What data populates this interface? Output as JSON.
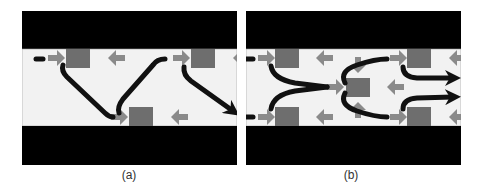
{
  "colors": {
    "wall": "#000000",
    "channel": "#f2f2f2",
    "block": "#6e6e6e",
    "arrow_grey": "#8a8a8a",
    "flow": "#111111"
  },
  "panels": [
    {
      "id": "a",
      "caption": "(a)",
      "x": 22,
      "width": 215,
      "height": 154,
      "channel": {
        "y": 38,
        "h": 77
      },
      "blocks": [
        {
          "x": 33,
          "y": 38,
          "w": 24,
          "h": 19
        },
        {
          "x": 158,
          "y": 38,
          "w": 24,
          "h": 19
        },
        {
          "x": 96,
          "y": 96,
          "w": 24,
          "h": 19
        }
      ],
      "grey_arrows": [
        {
          "x": 15,
          "y": 47,
          "dir": "right"
        },
        {
          "x": 75,
          "y": 47,
          "dir": "left"
        },
        {
          "x": 140,
          "y": 47,
          "dir": "right"
        },
        {
          "x": 200,
          "y": 47,
          "dir": "left"
        },
        {
          "x": 78,
          "y": 106,
          "dir": "right"
        },
        {
          "x": 138,
          "y": 106,
          "dir": "left"
        }
      ],
      "flows": [
        {
          "d": "M 3 48 L 10 48",
          "arrowhead": false
        },
        {
          "d": "M 30 54 Q 28 60 34 66 L 72 102 Q 76 106 80 106",
          "arrowhead": false
        },
        {
          "d": "M 86 102 Q 84 96 90 88 L 120 54 Q 124 48 132 48",
          "arrowhead": false
        },
        {
          "d": "M 151 56 Q 150 64 158 70 L 200 100",
          "arrowhead": true
        }
      ]
    },
    {
      "id": "b",
      "caption": "(b)",
      "x": 246,
      "width": 215,
      "height": 154,
      "channel": {
        "y": 38,
        "h": 77
      },
      "blocks": [
        {
          "x": 18,
          "y": 38,
          "w": 24,
          "h": 19
        },
        {
          "x": 18,
          "y": 96,
          "w": 24,
          "h": 19
        },
        {
          "x": 89,
          "y": 67,
          "w": 24,
          "h": 19
        },
        {
          "x": 150,
          "y": 38,
          "w": 24,
          "h": 19
        },
        {
          "x": 150,
          "y": 96,
          "w": 24,
          "h": 19
        }
      ],
      "grey_arrows": [
        {
          "x": 1,
          "y": 47,
          "dir": "right"
        },
        {
          "x": 59,
          "y": 47,
          "dir": "left"
        },
        {
          "x": 1,
          "y": 106,
          "dir": "right"
        },
        {
          "x": 59,
          "y": 106,
          "dir": "left"
        },
        {
          "x": 70,
          "y": 76,
          "dir": "right"
        },
        {
          "x": 130,
          "y": 76,
          "dir": "left"
        },
        {
          "x": 101,
          "y": 54,
          "dir": "down"
        },
        {
          "x": 101,
          "y": 99,
          "dir": "up"
        },
        {
          "x": 133,
          "y": 47,
          "dir": "right"
        },
        {
          "x": 192,
          "y": 47,
          "dir": "left"
        },
        {
          "x": 133,
          "y": 106,
          "dir": "right"
        },
        {
          "x": 192,
          "y": 106,
          "dir": "left"
        }
      ],
      "flows": [
        {
          "d": "M -11 48 L -4 48",
          "arrowhead": false
        },
        {
          "d": "M -11 106 L -4 106",
          "arrowhead": false
        },
        {
          "d": "M 14 55 Q 16 68 38 72 L 70 76",
          "arrowhead": false
        },
        {
          "d": "M 14 98 Q 16 84 38 80 L 70 76",
          "arrowhead": false
        },
        {
          "d": "M 88 72 Q 82 60 100 54 Q 118 48 130 48",
          "arrowhead": false
        },
        {
          "d": "M 88 82 Q 82 94 100 100 Q 118 106 130 106",
          "arrowhead": false
        },
        {
          "d": "M 146 56 Q 146 66 160 67 L 196 67",
          "arrowhead": true
        },
        {
          "d": "M 146 98 Q 146 88 160 87 L 196 86",
          "arrowhead": true
        }
      ]
    }
  ]
}
